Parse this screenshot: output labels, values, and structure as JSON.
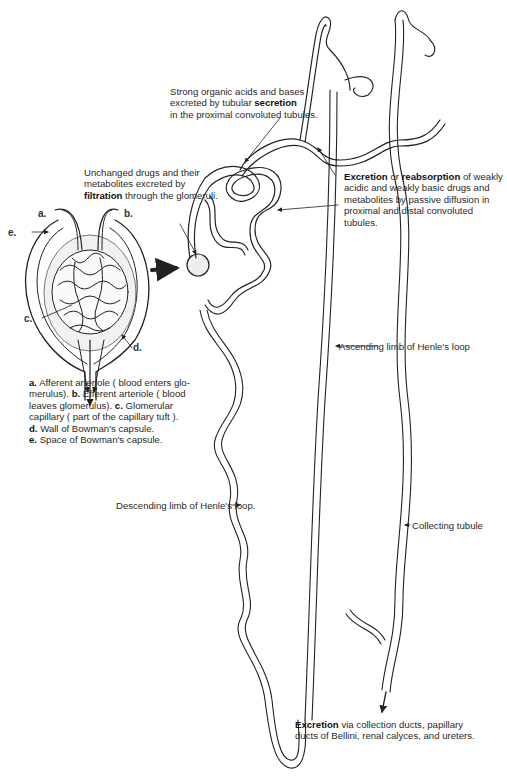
{
  "diagram": {
    "labels": {
      "secretion": {
        "line1": "Strong organic acids and bases",
        "line2_pre": "excreted by tubular ",
        "line2_bold": "secretion",
        "line3": "in the proximal convoluted tubules."
      },
      "filtration": {
        "line1": "Unchanged drugs and their",
        "line2": "metabolites excreted by",
        "line3_bold": "filtration",
        "line3_post": " through the glomeruli."
      },
      "reabsorption": {
        "bold1": "Excretion",
        "mid": " or ",
        "bold2": "reabsorption",
        "line1_post": " of weakly",
        "line2": "acidic and weakly basic drugs and",
        "line3": "metabolites by passive diffusion in",
        "line4": "proximal and distal convoluted",
        "line5": "tubules."
      },
      "ascending_limb": "Ascending limb of Henle's loop",
      "descending_limb": "Descending limb of Henle's loop.",
      "collecting_tubule": "Collecting tubule",
      "excretion": {
        "bold": "Excretion",
        "line1_post": " via collection ducts, papillary",
        "line2": "ducts of Bellini, renal calyces, and ureters."
      }
    },
    "glomerulus_letters": {
      "a": "a.",
      "b": "b.",
      "c": "c.",
      "d": "d.",
      "e": "e."
    },
    "legend": {
      "a_key": "a.",
      "a_text": " Afferent arteriole ( blood enters glo-",
      "line2_pre": "merulus). ",
      "b_key": "b.",
      "b_text": " Efferent arteriole ( blood",
      "line3_pre": "leaves glomerulus). ",
      "c_key": "c.",
      "c_text": " Glomerular",
      "line4": "capillary ( part of the capillary tuft ).",
      "d_key": "d.",
      "d_text": " Wall of Bowman's capsule.",
      "e_key": "e.",
      "e_text": " Space of Bowman's capsule."
    }
  }
}
